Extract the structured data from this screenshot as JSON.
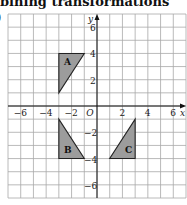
{
  "header": {
    "title": "bining transformations",
    "part_label": ")"
  },
  "colors": {
    "shape_fill": "#9c9c9c",
    "shape_stroke": "#222222",
    "grid": "#a8a8a8",
    "axis": "#111111"
  },
  "axes": {
    "x_label": "x",
    "y_label": "y",
    "origin_label": "O",
    "x_range": [
      -7,
      7
    ],
    "y_range": [
      -7,
      7
    ],
    "x_ticks": [
      {
        "value": -6,
        "label": "−6"
      },
      {
        "value": -4,
        "label": "−4"
      },
      {
        "value": -2,
        "label": "−2"
      },
      {
        "value": 2,
        "label": "2"
      },
      {
        "value": 4,
        "label": "4"
      },
      {
        "value": 6,
        "label": "6"
      }
    ],
    "y_ticks": [
      {
        "value": 6,
        "label": "6"
      },
      {
        "value": 4,
        "label": "4"
      },
      {
        "value": 2,
        "label": "2"
      },
      {
        "value": -2,
        "label": "−2"
      },
      {
        "value": -4,
        "label": "−4"
      },
      {
        "value": -6,
        "label": "−6"
      }
    ]
  },
  "shapes": [
    {
      "label": "A",
      "vertices": [
        [
          -3,
          4
        ],
        [
          -1,
          4
        ],
        [
          -3,
          1
        ]
      ],
      "label_pos": [
        -2.6,
        3.1
      ]
    },
    {
      "label": "B",
      "vertices": [
        [
          -3,
          -1
        ],
        [
          -3,
          -4
        ],
        [
          -1,
          -4
        ]
      ],
      "label_pos": [
        -2.6,
        -3.6
      ]
    },
    {
      "label": "C",
      "vertices": [
        [
          3,
          -1
        ],
        [
          3,
          -4
        ],
        [
          1,
          -4
        ]
      ],
      "label_pos": [
        2.2,
        -3.6
      ]
    }
  ]
}
